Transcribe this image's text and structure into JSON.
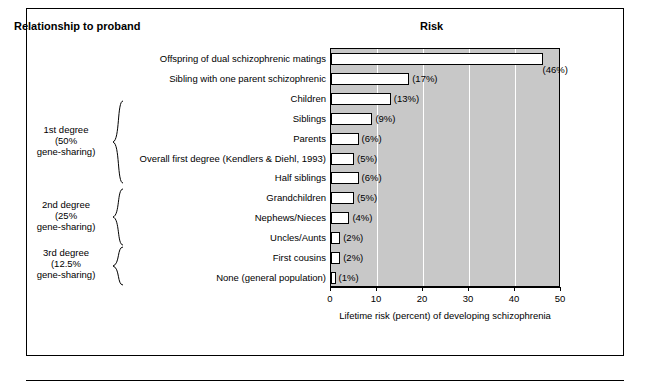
{
  "headings": {
    "left": "Relationship to proband",
    "right": "Risk"
  },
  "groups": [
    {
      "name": "1st degree",
      "line1": "1st degree",
      "line2": "(50%",
      "line3": "gene-sharing)"
    },
    {
      "name": "2nd degree",
      "line1": "2nd degree",
      "line2": "(25%",
      "line3": "gene-sharing)"
    },
    {
      "name": "3rd degree",
      "line1": "3rd degree",
      "line2": "(12.5%",
      "line3": "gene-sharing)"
    }
  ],
  "chart_data": {
    "type": "bar",
    "orientation": "horizontal",
    "title": "Risk",
    "xlabel": "Lifetime risk (percent) of developing schizophrenia",
    "ylabel": "Relationship to proband",
    "xlim": [
      0,
      50
    ],
    "xticks": [
      0,
      10,
      20,
      30,
      40,
      50
    ],
    "grid": true,
    "categories": [
      "Offspring of dual schizophrenic matings",
      "Sibling with one parent schizophrenic",
      "Children",
      "Siblings",
      "Parents",
      "Overall first degree (Kendlers & Diehl, 1993)",
      "Half siblings",
      "Grandchildren",
      "Nephews/Nieces",
      "Uncles/Aunts",
      "First cousins",
      "None (general population)"
    ],
    "values": [
      46,
      17,
      13,
      9,
      6,
      5,
      6,
      5,
      4,
      2,
      2,
      1
    ],
    "value_labels": [
      "(46%)",
      "(17%)",
      "(13%)",
      "(9%)",
      "(6%)",
      "(5%)",
      "(6%)",
      "(5%)",
      "(4%)",
      "(2%)",
      "(2%)",
      "(1%)"
    ],
    "bar_color": "#ffffff",
    "bar_border_color": "#000000",
    "plot_background": "#c8c8c8",
    "gridline_color": "#ffffff"
  }
}
